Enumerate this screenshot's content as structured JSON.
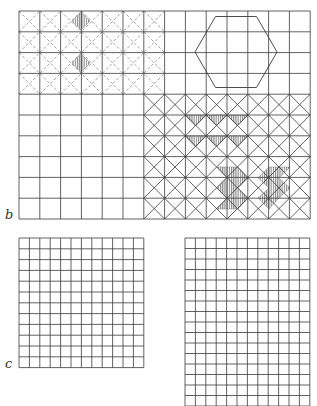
{
  "figure": {
    "labels": [
      {
        "id": "b",
        "text": "b",
        "x": 5,
        "y": 208
      },
      {
        "id": "c",
        "text": "c",
        "x": 5,
        "y": 357
      }
    ],
    "colors": {
      "line": "#3a3a3a",
      "dashed": "#8a8a8a",
      "hatch": "#6a6a6a",
      "background": "#ffffff"
    },
    "panel_b": {
      "x": 19,
      "y": 11,
      "cols": 14,
      "rows": 10,
      "cell": 20.8,
      "dashed_diagonals": {
        "region": {
          "x0": 0,
          "y0": 0,
          "x1": 7,
          "y1": 4
        }
      },
      "solid_diagonals": {
        "region": {
          "x0": 6,
          "y0": 4,
          "x1": 14,
          "y1": 10
        }
      },
      "hexagon": {
        "cx": 236,
        "cy": 52,
        "r": 41
      },
      "hatched_diamonds_small": [
        {
          "cx": 81,
          "cy": 21,
          "r": 9
        },
        {
          "cx": 81,
          "cy": 63,
          "r": 9
        }
      ],
      "hatched_triangles_down": [
        {
          "x": 185,
          "y": 115,
          "w": 21,
          "h": 11
        },
        {
          "x": 206,
          "y": 115,
          "w": 21,
          "h": 11
        },
        {
          "x": 227,
          "y": 115,
          "w": 21,
          "h": 11
        },
        {
          "x": 185,
          "y": 136,
          "w": 21,
          "h": 11
        },
        {
          "x": 206,
          "y": 136,
          "w": 21,
          "h": 11
        },
        {
          "x": 227,
          "y": 136,
          "w": 21,
          "h": 11
        }
      ],
      "hatched_polygons": [
        [
          [
            217,
            167
          ],
          [
            238,
            167
          ],
          [
            248,
            178
          ],
          [
            238,
            188
          ],
          [
            248,
            198
          ],
          [
            238,
            209
          ],
          [
            217,
            209
          ],
          [
            227,
            198
          ],
          [
            217,
            188
          ],
          [
            227,
            178
          ]
        ],
        [
          [
            258,
            178
          ],
          [
            269,
            167
          ],
          [
            290,
            167
          ],
          [
            279,
            178
          ],
          [
            290,
            188
          ],
          [
            279,
            198
          ],
          [
            269,
            209
          ],
          [
            258,
            198
          ],
          [
            269,
            188
          ]
        ]
      ]
    },
    "panel_c_left": {
      "x": 19,
      "y": 238,
      "cols": 12,
      "rows": 12,
      "cellw": 10.4,
      "cellh": 10.8
    },
    "panel_c_right": {
      "x": 185,
      "y": 238,
      "cols": 12,
      "rows": 16,
      "cellw": 10.4,
      "cellh": 10.5
    }
  }
}
